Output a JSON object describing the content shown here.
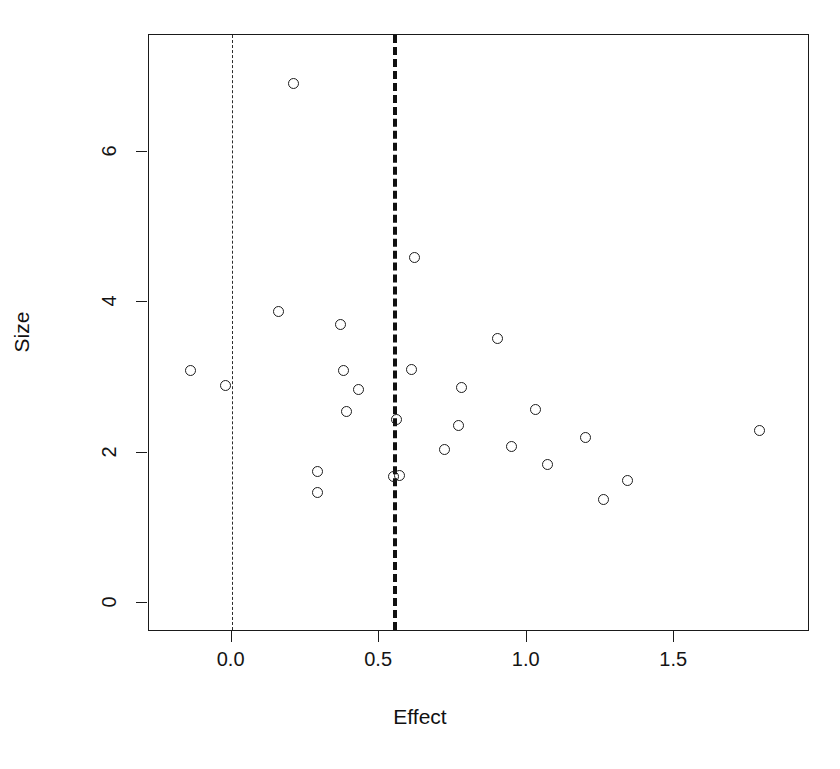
{
  "chart_data": {
    "type": "scatter",
    "title": "",
    "xlabel": "Effect",
    "ylabel": "Size",
    "xlim": [
      -0.28,
      1.96
    ],
    "ylim": [
      -0.38,
      7.55
    ],
    "xticks": [
      0.0,
      0.5,
      1.0,
      1.5
    ],
    "xticklabels": [
      "0.0",
      "0.5",
      "1.0",
      "1.5"
    ],
    "yticks": [
      0,
      2,
      4,
      6
    ],
    "yticklabels": [
      "0",
      "2",
      "4",
      "6"
    ],
    "grid": false,
    "legend": null,
    "marker": "open-circle",
    "series": [
      {
        "name": "studies",
        "points": [
          {
            "x": -0.14,
            "y": 3.09
          },
          {
            "x": -0.02,
            "y": 2.89
          },
          {
            "x": 0.16,
            "y": 3.88
          },
          {
            "x": 0.21,
            "y": 6.9
          },
          {
            "x": 0.29,
            "y": 1.75
          },
          {
            "x": 0.29,
            "y": 1.47
          },
          {
            "x": 0.37,
            "y": 3.7
          },
          {
            "x": 0.38,
            "y": 3.09
          },
          {
            "x": 0.39,
            "y": 2.55
          },
          {
            "x": 0.43,
            "y": 2.84
          },
          {
            "x": 0.55,
            "y": 1.68
          },
          {
            "x": 0.56,
            "y": 2.44
          },
          {
            "x": 0.57,
            "y": 1.7
          },
          {
            "x": 0.61,
            "y": 3.11
          },
          {
            "x": 0.62,
            "y": 4.6
          },
          {
            "x": 0.72,
            "y": 2.04
          },
          {
            "x": 0.77,
            "y": 2.36
          },
          {
            "x": 0.78,
            "y": 2.87
          },
          {
            "x": 0.9,
            "y": 3.52
          },
          {
            "x": 0.95,
            "y": 2.08
          },
          {
            "x": 1.03,
            "y": 2.58
          },
          {
            "x": 1.07,
            "y": 1.84
          },
          {
            "x": 1.2,
            "y": 2.2
          },
          {
            "x": 1.26,
            "y": 1.38
          },
          {
            "x": 1.34,
            "y": 1.63
          },
          {
            "x": 1.79,
            "y": 2.29
          }
        ]
      }
    ],
    "reference_lines": [
      {
        "name": "null-effect-line",
        "x": 0.0,
        "style": "thin-dashed",
        "color": "#2b2b2b"
      },
      {
        "name": "pooled-effect-line",
        "x": 0.555,
        "style": "thick-dashed",
        "color": "#101010"
      }
    ],
    "colors": {
      "axis": "#1a1a1a",
      "marker_stroke": "#1d1d1d",
      "background": "#ffffff",
      "null_line": "#2b2b2b",
      "effect_line": "#101010"
    }
  }
}
